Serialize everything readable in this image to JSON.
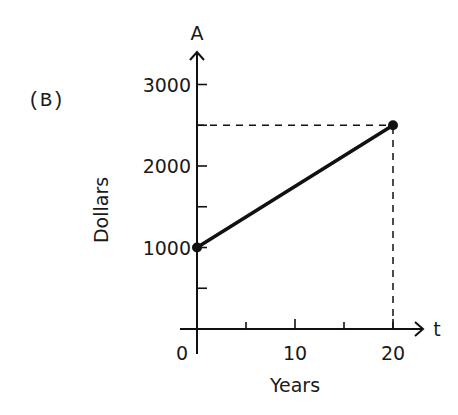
{
  "chart_data": {
    "type": "line",
    "panel_label": "(B)",
    "title": "",
    "xlabel": "Years",
    "ylabel": "Dollars",
    "x_axis_name": "t",
    "y_axis_name": "A",
    "xlim": [
      0,
      23
    ],
    "ylim": [
      0,
      3300
    ],
    "x_ticks": [
      0,
      5,
      10,
      15,
      20
    ],
    "x_tick_labels": [
      {
        "value": 0,
        "label": "0"
      },
      {
        "value": 10,
        "label": "10"
      },
      {
        "value": 20,
        "label": "20"
      }
    ],
    "y_ticks": [
      500,
      1000,
      1500,
      2000,
      2500,
      3000
    ],
    "y_tick_labels": [
      {
        "value": 1000,
        "label": "1000"
      },
      {
        "value": 2000,
        "label": "2000"
      },
      {
        "value": 3000,
        "label": "3000"
      }
    ],
    "grid": false,
    "legend": "none",
    "series": [
      {
        "name": "A",
        "x": [
          0,
          20
        ],
        "y": [
          1000,
          2500
        ],
        "markers": true
      }
    ],
    "guides": [
      {
        "type": "horizontal-dashed",
        "y": 2500,
        "from_x": 0,
        "to_x": 20
      },
      {
        "type": "vertical-dashed",
        "x": 20,
        "from_y": 0,
        "to_y": 2500
      }
    ]
  }
}
